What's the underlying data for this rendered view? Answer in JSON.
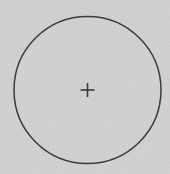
{
  "figure": {
    "type": "geometric-diagram",
    "width": 170,
    "height": 174,
    "background_color": "#d6d6d6",
    "stroke_color": "#3c3c3c",
    "texture": "fine-grain-noise",
    "labels": [],
    "annotations": []
  },
  "shapes": {
    "circle": {
      "name": "outline-circle",
      "center_x": 87.5,
      "center_y": 90,
      "radius": 73.5,
      "stroke_width": 1.5,
      "stroke_color": "#3c3c3c",
      "fill": "none"
    },
    "crosshair": {
      "name": "center-crosshair",
      "center_x": 87.5,
      "center_y": 90,
      "arm_length": 7,
      "stroke_width": 1.6,
      "stroke_color": "#3c3c3c",
      "glyph": "plus"
    }
  },
  "chart_data": {
    "type": "scatter",
    "xlabel": "",
    "ylabel": "",
    "xlim": [
      0,
      170
    ],
    "ylim": [
      0,
      174
    ],
    "grid": false,
    "legend": "none",
    "series": [
      {
        "name": "center-point",
        "marker": "plus",
        "x": [
          87.5
        ],
        "y": [
          90
        ]
      }
    ],
    "annotations": [
      {
        "kind": "circle",
        "cx": 87.5,
        "cy": 90,
        "r": 73.5
      }
    ]
  }
}
